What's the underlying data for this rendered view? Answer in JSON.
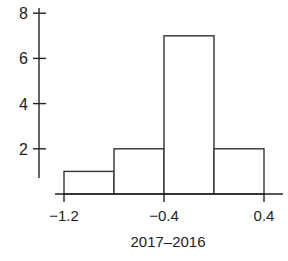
{
  "chart_data": {
    "type": "bar",
    "subtype": "histogram",
    "title": "",
    "xlabel": "2017–2016",
    "ylabel": "",
    "bins": [
      {
        "start": -1.2,
        "end": -0.8,
        "count": 1
      },
      {
        "start": -0.8,
        "end": -0.4,
        "count": 2
      },
      {
        "start": -0.4,
        "end": 0.0,
        "count": 7
      },
      {
        "start": 0.0,
        "end": 0.4,
        "count": 2
      }
    ],
    "categories": [
      "-1.2 to -0.8",
      "-0.8 to -0.4",
      "-0.4 to 0.0",
      "0.0 to 0.4"
    ],
    "values": [
      1,
      2,
      7,
      2
    ],
    "xticks": [
      -1.2,
      -0.4,
      0.4
    ],
    "xtick_labels": [
      "−1.2",
      "−0.4",
      "0.4"
    ],
    "yticks": [
      2,
      4,
      6,
      8
    ],
    "ytick_labels": [
      "2",
      "4",
      "6",
      "8"
    ],
    "xlim": [
      -1.3,
      0.5
    ],
    "ylim": [
      0,
      8
    ],
    "grid": false,
    "legend": null,
    "colors": {
      "bar_fill": "#ffffff",
      "bar_stroke": "#333333",
      "axis": "#222222"
    }
  }
}
